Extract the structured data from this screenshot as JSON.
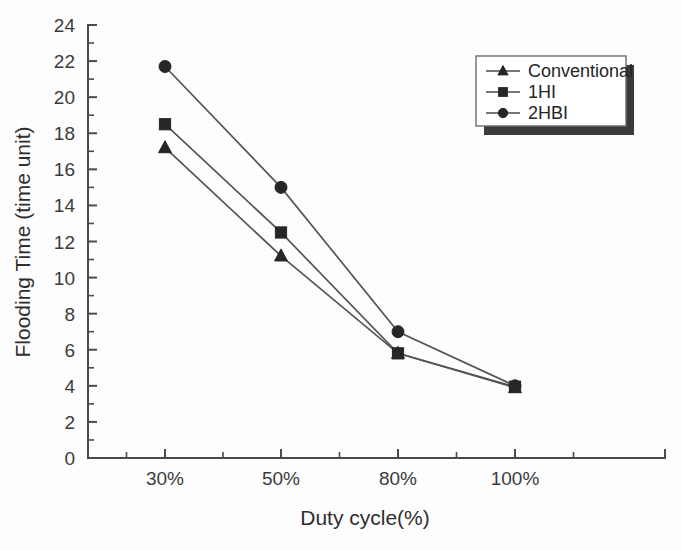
{
  "chart_data": {
    "type": "line",
    "title": "",
    "xlabel": "Duty cycle(%)",
    "ylabel": "Flooding Time (time unit)",
    "categories": [
      "30%",
      "50%",
      "80%",
      "100%"
    ],
    "x_tick_labels": [
      "30%",
      "50%",
      "80%",
      "100%"
    ],
    "y_tick_labels": [
      "0",
      "2",
      "4",
      "6",
      "8",
      "10",
      "12",
      "14",
      "16",
      "18",
      "20",
      "22",
      "24"
    ],
    "y_tick_values": [
      0,
      2,
      4,
      6,
      8,
      10,
      12,
      14,
      16,
      18,
      20,
      22,
      24
    ],
    "ylim": [
      0,
      24
    ],
    "y_minor_step": 1,
    "grid": false,
    "legend_position": "top-right",
    "series": [
      {
        "name": "Conventional",
        "marker": "triangle",
        "color": "#262626",
        "values": [
          17.2,
          11.2,
          5.8,
          3.9
        ]
      },
      {
        "name": "1HI",
        "marker": "square",
        "color": "#262626",
        "values": [
          18.5,
          12.5,
          5.8,
          3.95
        ]
      },
      {
        "name": "2HBI",
        "marker": "circle",
        "color": "#262626",
        "values": [
          21.7,
          15.0,
          7.0,
          4.0
        ]
      }
    ]
  },
  "legend": {
    "entries": [
      {
        "label": "Conventional",
        "marker": "triangle-icon"
      },
      {
        "label": "1HI",
        "marker": "square-icon"
      },
      {
        "label": "2HBI",
        "marker": "circle-icon"
      }
    ]
  },
  "colors": {
    "axis": "#4a4a4a",
    "marker": "#262626",
    "line": "#555555",
    "background": "#fdfdfd",
    "legend_shadow": "#3a3a3a"
  }
}
